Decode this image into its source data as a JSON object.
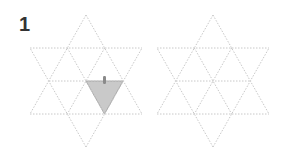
{
  "figure": {
    "label": "1",
    "line_color": "#c8c8c8",
    "fill_color": "#c9c9c9",
    "fill_stroke": "#9a9a9a",
    "marker_color": "#8a8a8a"
  },
  "left_star": {
    "top": [
      86,
      15
    ],
    "bottom": [
      86,
      147
    ],
    "upper_y": 48,
    "lower_y": 114,
    "mid_y": 81,
    "x_left": 30,
    "x_right": 142,
    "mid_left": 49,
    "mid_center": 86,
    "mid_right": 123,
    "highlighted_triangle": [
      [
        86,
        81
      ],
      [
        123,
        81
      ],
      [
        104.5,
        114
      ]
    ],
    "marker": {
      "x": 103,
      "y": 76,
      "w": 3,
      "h": 8
    }
  },
  "right_star": {
    "top": [
      213,
      15
    ],
    "bottom": [
      213,
      147
    ],
    "upper_y": 48,
    "lower_y": 114,
    "mid_y": 81,
    "x_left": 157,
    "x_right": 269,
    "mid_left": 176,
    "mid_center": 213,
    "mid_right": 250
  }
}
